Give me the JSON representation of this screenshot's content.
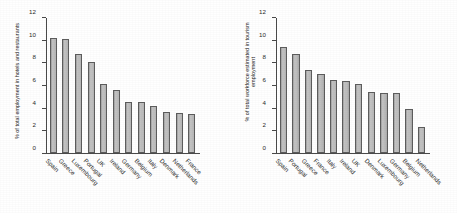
{
  "chart_data": [
    {
      "type": "bar",
      "title": "",
      "xlabel": "",
      "ylabel": "% of total employment in hotels and restaurants",
      "ylim": [
        0,
        12
      ],
      "yticks": [
        0,
        2,
        4,
        6,
        8,
        10,
        12
      ],
      "grid": false,
      "legend": "none",
      "categories": [
        "Spain",
        "Greece",
        "Luxembourg",
        "Portugal",
        "UK",
        "Ireland",
        "Germany",
        "Belgium",
        "Italy",
        "Denmark",
        "Netherlands",
        "France"
      ],
      "values": [
        10.2,
        10.1,
        8.8,
        8.1,
        6.1,
        5.6,
        4.5,
        4.5,
        4.15,
        3.65,
        3.55,
        3.45
      ]
    },
    {
      "type": "bar",
      "title": "",
      "xlabel": "",
      "ylabel": "% of total workforce estimated in tourism employment",
      "ylim": [
        0,
        12
      ],
      "yticks": [
        0,
        2,
        4,
        6,
        8,
        10,
        12
      ],
      "grid": false,
      "legend": "none",
      "categories": [
        "Spain",
        "Portugal",
        "Greece",
        "France",
        "Italy",
        "Ireland",
        "UK",
        "Denmark",
        "Luxembourg",
        "Germany",
        "Belgium",
        "Netherlands"
      ],
      "values": [
        9.45,
        8.8,
        7.35,
        7.0,
        6.5,
        6.4,
        6.1,
        5.4,
        5.3,
        5.3,
        3.95,
        2.3
      ]
    }
  ],
  "style": {
    "bar_fill": "#b8b8b8",
    "bar_stroke": "#5d5d5d",
    "axis_color": "#4a4a4a",
    "text_color": "#2b2b2b",
    "background": "#ffffff"
  }
}
